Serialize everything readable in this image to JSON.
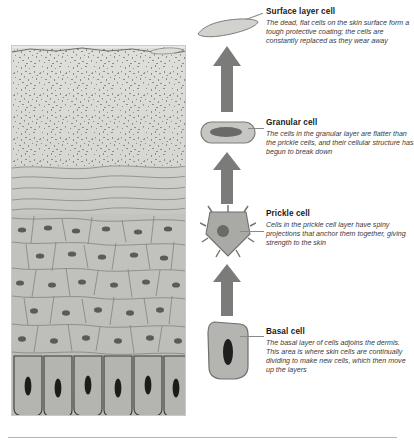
{
  "diagram": {
    "panel": {
      "name": "skin-cross-section"
    },
    "layers": [
      {
        "id": "surface",
        "label": "Surface layer (stippled dead cells)"
      },
      {
        "id": "granular",
        "label": "Granular layer (flattened cells)"
      },
      {
        "id": "prickle",
        "label": "Prickle cell layer (polygonal cells)"
      },
      {
        "id": "basal",
        "label": "Basal layer (columnar cells)"
      },
      {
        "id": "dermis",
        "label": "Dermis"
      }
    ],
    "colors": {
      "cell_fill": "#b6b6b2",
      "cell_stroke": "#6e6e6c",
      "nucleus": "#4a4a48",
      "arrow": "#7b7b79",
      "leader": "#8a8a88",
      "panel_bg": "#e9e9e7",
      "text": "#1a1a1a",
      "desc_text": "#3a3a3a"
    },
    "callouts": [
      {
        "id": "surface-layer-cell",
        "title": "Surface layer cell",
        "description": "The dead, flat cells on the skin surface form a tough protective coating; the cells are constantly replaced as they wear away"
      },
      {
        "id": "granular-cell",
        "title": "Granular cell",
        "description": "The cells in the granular layer are flatter than the prickle cells, and their cellular structure has begun to break down"
      },
      {
        "id": "prickle-cell",
        "title": "Prickle cell",
        "description": "Cells in the prickle cell layer have spiny projections that anchor them together, giving strength to the skin"
      },
      {
        "id": "basal-cell",
        "title": "Basal cell",
        "description": "The basal layer of cells adjoins the dermis. This area is where skin cells are continually dividing to make new cells, which then move up the layers"
      }
    ],
    "arrows": [
      {
        "id": "arrow-basal-to-prickle",
        "direction": "up"
      },
      {
        "id": "arrow-prickle-to-granular",
        "direction": "up"
      },
      {
        "id": "arrow-granular-to-surface",
        "direction": "up"
      }
    ]
  }
}
